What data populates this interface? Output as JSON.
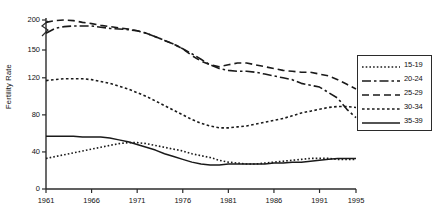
{
  "chart_data": {
    "type": "line",
    "title": "",
    "xlabel": "",
    "ylabel": "Fertility Rate",
    "xlim": [
      1961,
      1995
    ],
    "ylim": [
      0,
      200
    ],
    "grid": false,
    "axis_break": true,
    "axis_break_between": [
      150,
      200
    ],
    "legend_position": "right",
    "xticks": [
      "1961",
      "1966",
      "1971",
      "1976",
      "1981",
      "1986",
      "1991",
      "1995"
    ],
    "xtick_values": [
      1961,
      1966,
      1971,
      1976,
      1981,
      1986,
      1991,
      1995
    ],
    "yticks": [
      "0",
      "40",
      "80",
      "120",
      "150",
      "200"
    ],
    "ytick_values": [
      0,
      40,
      80,
      120,
      150,
      200
    ],
    "x": [
      1961,
      1962,
      1963,
      1964,
      1965,
      1966,
      1967,
      1968,
      1969,
      1970,
      1971,
      1972,
      1973,
      1974,
      1975,
      1976,
      1977,
      1978,
      1979,
      1980,
      1981,
      1982,
      1983,
      1984,
      1985,
      1986,
      1987,
      1988,
      1989,
      1990,
      1991,
      1992,
      1993,
      1994,
      1995
    ],
    "series": [
      {
        "name": "15-19",
        "style": "dotted",
        "values": [
          33,
          35,
          37,
          39,
          41,
          43,
          45,
          47,
          49,
          50,
          50,
          49,
          47,
          45,
          43,
          41,
          38,
          36,
          34,
          31,
          29,
          28,
          27,
          27,
          28,
          29,
          30,
          31,
          32,
          33,
          33,
          33,
          32,
          32,
          32
        ]
      },
      {
        "name": "20-24",
        "style": "dash-dot",
        "values": [
          178,
          186,
          189,
          190,
          190,
          190,
          188,
          186,
          185,
          184,
          182,
          178,
          172,
          166,
          160,
          152,
          146,
          140,
          134,
          130,
          128,
          127,
          127,
          126,
          124,
          122,
          120,
          118,
          114,
          112,
          110,
          104,
          98,
          86,
          77
        ]
      },
      {
        "name": "25-29",
        "style": "dashed",
        "values": [
          196,
          199,
          200,
          199,
          196,
          194,
          191,
          189,
          187,
          185,
          182,
          178,
          172,
          166,
          160,
          152,
          144,
          138,
          134,
          132,
          134,
          136,
          136,
          134,
          132,
          130,
          128,
          127,
          126,
          126,
          124,
          122,
          118,
          113,
          108
        ]
      },
      {
        "name": "30-34",
        "style": "fine-dotted",
        "values": [
          117,
          118,
          119,
          119,
          119,
          118,
          116,
          114,
          111,
          108,
          104,
          100,
          95,
          90,
          85,
          80,
          75,
          71,
          68,
          66,
          66,
          67,
          68,
          70,
          72,
          74,
          76,
          79,
          82,
          84,
          86,
          88,
          89,
          89,
          88
        ]
      },
      {
        "name": "35-39",
        "style": "solid",
        "values": [
          57,
          57,
          57,
          57,
          56,
          56,
          56,
          55,
          53,
          51,
          48,
          45,
          42,
          38,
          35,
          32,
          29,
          27,
          26,
          26,
          27,
          27,
          27,
          27,
          27,
          28,
          28,
          29,
          29,
          30,
          31,
          32,
          33,
          33,
          33
        ]
      }
    ]
  }
}
